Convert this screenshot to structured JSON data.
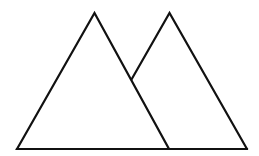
{
  "diagram": {
    "canvas": {
      "width": 259,
      "height": 156,
      "background": "#ffffff"
    },
    "stroke": {
      "color": "#111111",
      "width": 2.2
    },
    "shapes": [
      {
        "name": "left-triangle",
        "type": "polygon",
        "points": [
          [
            17,
            149
          ],
          [
            94.5,
            13
          ],
          [
            169,
            149
          ]
        ]
      },
      {
        "name": "right-triangle-visible-outline",
        "type": "polyline",
        "points": [
          [
            131.2,
            80
          ],
          [
            169.5,
            13
          ],
          [
            247,
            149
          ]
        ]
      },
      {
        "name": "shared-baseline",
        "type": "line",
        "points": [
          [
            17,
            149
          ],
          [
            247,
            149
          ]
        ]
      }
    ]
  }
}
